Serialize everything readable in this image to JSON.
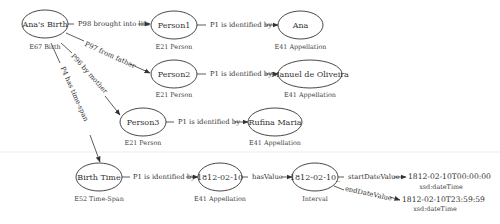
{
  "nodes": {
    "anas_birth": {
      "label": "Ana's Birth",
      "type": "E67 Birth"
    },
    "person1": {
      "label": "Person1",
      "type": "E21 Person"
    },
    "person2": {
      "label": "Person2",
      "type": "E21 Person"
    },
    "person3": {
      "label": "Person3",
      "type": "E21 Person"
    },
    "ana": {
      "label": "Ana",
      "type": "E41 Appellation"
    },
    "manuel": {
      "label": "Manuel de Oliveira",
      "type": "E41 Appellation"
    },
    "rufina": {
      "label": "Rufina Maria",
      "type": "E41 Appellation"
    },
    "birth_time": {
      "label": "Birth Time",
      "type": "E52 Time-Span"
    },
    "date_appellation": {
      "label": "1812-02-10",
      "type": "E41 Appellation"
    },
    "interval": {
      "label": "1812-02-10_",
      "type": "Interval"
    },
    "start_literal": {
      "label": "1812-02-10T00:00:00",
      "type": "xsd:dateTime"
    },
    "end_literal": {
      "label": "1812-02-10T23:59:59",
      "type": "xsd:dateTime"
    }
  },
  "edges": {
    "p98": "P98 brought into life",
    "p97": "P97 from father",
    "p96": "P96 by mother",
    "p4": "P4 has time-span",
    "p1_person1": "P1 is identified by",
    "p1_person2": "P1 is identified by",
    "p1_person3": "P1 is identified by",
    "p1_birth_time": "P1 is identified by",
    "has_value": "hasValue",
    "start_date_value": "startDateValue",
    "end_date_value": "endDateValue"
  }
}
